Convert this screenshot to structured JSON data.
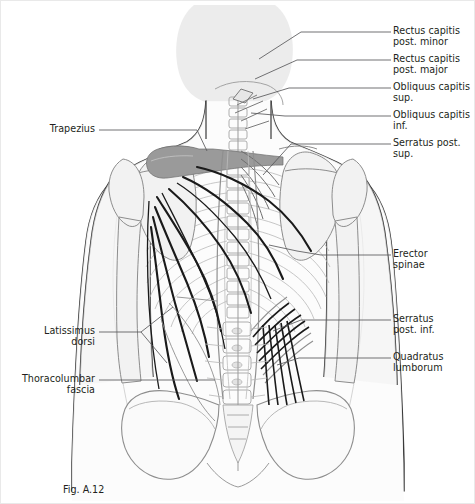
{
  "figure": {
    "caption": "Fig. A.12",
    "caption_x": 62,
    "caption_y": 483,
    "background": "#ffffff",
    "border_color": "#e9e9e9",
    "text_color": "#231f20",
    "leader_color": "#58595b",
    "skin_outline": "#3a3a3a",
    "bone_outline": "#8d8d8d",
    "bone_fill": "#f2f2f2",
    "body_fill": "#fbfbfb",
    "head_fill": "#ececec",
    "muscle_dark": "#9a9a9a",
    "fiber_dark": "#1a1a1a",
    "fiber_mid": "#7b7b7b"
  },
  "labels_right": [
    {
      "id": "rectus-capitis-post-minor",
      "text": "Rectus capitis\npost. minor",
      "x": 392,
      "y": 26,
      "leader_x1": 374,
      "leader_y1": 31,
      "leader_x2": 390,
      "leader_y2": 31
    },
    {
      "id": "rectus-capitis-post-major",
      "text": "Rectus capitis\npost. major",
      "x": 392,
      "y": 54,
      "leader_x1": 374,
      "leader_y1": 59,
      "leader_x2": 390,
      "leader_y2": 59
    },
    {
      "id": "obliquus-capitis-sup",
      "text": "Obliquus capitis\nsup.",
      "x": 392,
      "y": 82,
      "leader_x1": 374,
      "leader_y1": 87,
      "leader_x2": 390,
      "leader_y2": 87
    },
    {
      "id": "obliquus-capitis-inf",
      "text": "Obliquus capitis\ninf.",
      "x": 392,
      "y": 110,
      "leader_x1": 374,
      "leader_y1": 115,
      "leader_x2": 390,
      "leader_y2": 115
    },
    {
      "id": "serratus-post-sup",
      "text": "Serratus post.\nsup.",
      "x": 392,
      "y": 138,
      "leader_x1": 374,
      "leader_y1": 143,
      "leader_x2": 390,
      "leader_y2": 143
    },
    {
      "id": "erector-spinae",
      "text": "Erector\nspinae",
      "x": 392,
      "y": 249,
      "leader_x1": 374,
      "leader_y1": 254,
      "leader_x2": 390,
      "leader_y2": 254
    },
    {
      "id": "serratus-post-inf",
      "text": "Serratus\npost. inf.",
      "x": 392,
      "y": 314,
      "leader_x1": 374,
      "leader_y1": 319,
      "leader_x2": 390,
      "leader_y2": 319
    },
    {
      "id": "quadratus-lumborum",
      "text": "Quadratus\nlumborum",
      "x": 392,
      "y": 352,
      "leader_x1": 374,
      "leader_y1": 357,
      "leader_x2": 390,
      "leader_y2": 357
    }
  ],
  "labels_left": [
    {
      "id": "trapezius",
      "text": "Trapezius",
      "x": 8,
      "y": 124,
      "width": 86,
      "leader_x1": 98,
      "leader_y1": 129,
      "leader_x2": 116,
      "leader_y2": 129
    },
    {
      "id": "latissimus-dorsi",
      "text": "Latissimus\ndorsi",
      "x": 8,
      "y": 326,
      "width": 86,
      "leader_x1": 98,
      "leader_y1": 331,
      "leader_x2": 116,
      "leader_y2": 331
    },
    {
      "id": "thoracolumbar-fascia",
      "text": "Thoracolumbar\nfascia",
      "x": 2,
      "y": 374,
      "width": 92,
      "leader_x1": 98,
      "leader_y1": 379,
      "leader_x2": 116,
      "leader_y2": 379
    }
  ],
  "structures": [
    {
      "name": "head-silhouette"
    },
    {
      "name": "neck"
    },
    {
      "name": "torso-outline"
    },
    {
      "name": "left-arm"
    },
    {
      "name": "right-arm"
    },
    {
      "name": "cervical-spine"
    },
    {
      "name": "thoracic-spine"
    },
    {
      "name": "lumbar-spine"
    },
    {
      "name": "sacrum"
    },
    {
      "name": "pelvis-left"
    },
    {
      "name": "pelvis-right"
    },
    {
      "name": "ribcage-left"
    },
    {
      "name": "ribcage-right"
    },
    {
      "name": "scapula-left"
    },
    {
      "name": "scapula-right"
    },
    {
      "name": "humerus-left"
    },
    {
      "name": "humerus-right"
    },
    {
      "name": "trapezius-attachment"
    },
    {
      "name": "latissimus-dorsi-fibers"
    },
    {
      "name": "erector-spinae-band"
    },
    {
      "name": "serratus-posterior-superior-fibers"
    },
    {
      "name": "serratus-posterior-inferior-fibers"
    },
    {
      "name": "quadratus-lumborum-fibers"
    },
    {
      "name": "suboccipital-muscles"
    }
  ]
}
